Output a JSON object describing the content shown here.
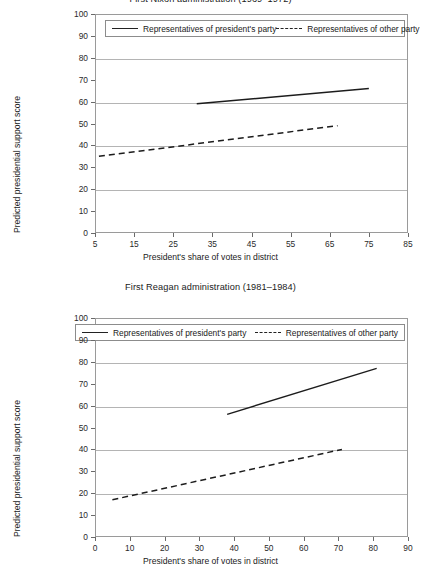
{
  "figure": {
    "y_axis_label": "Predicted presidential support score",
    "x_axis_label": "President's share of votes in district",
    "legend": {
      "president_party": "Representatives of president's party",
      "other_party": "Representatives of other party"
    }
  },
  "chart_data": [
    {
      "type": "line",
      "title": "First Nixon administration (1969–1972)",
      "xlabel": "President's share of votes in district",
      "ylabel": "Predicted presidential support score",
      "xlim": [
        5,
        85
      ],
      "ylim": [
        0,
        100
      ],
      "xticks": [
        5,
        15,
        25,
        35,
        45,
        55,
        65,
        75,
        85
      ],
      "yticks": [
        0,
        10,
        20,
        30,
        40,
        50,
        60,
        70,
        80,
        90,
        100
      ],
      "gridlines_y": [
        20,
        40,
        60,
        80,
        100
      ],
      "grid": "horizontal",
      "legend_position": "upper-center-inside",
      "series": [
        {
          "name": "Representatives of president's party",
          "style": "solid",
          "x": [
            31,
            75
          ],
          "values": [
            59,
            66
          ]
        },
        {
          "name": "Representatives of other party",
          "style": "dashed",
          "x": [
            6,
            67
          ],
          "values": [
            35,
            49
          ]
        }
      ]
    },
    {
      "type": "line",
      "title": "First Reagan administration (1981–1984)",
      "xlabel": "President's share of votes in district",
      "ylabel": "Predicted presidential support score",
      "xlim": [
        0,
        90
      ],
      "ylim": [
        0,
        100
      ],
      "xticks": [
        0,
        10,
        20,
        30,
        40,
        50,
        60,
        70,
        80,
        90
      ],
      "yticks": [
        0,
        10,
        20,
        30,
        40,
        50,
        60,
        70,
        80,
        90,
        100
      ],
      "gridlines_y": [
        20,
        40,
        60,
        80,
        100
      ],
      "grid": "horizontal",
      "legend_position": "upper-center-inside",
      "series": [
        {
          "name": "Representatives of president's party",
          "style": "solid",
          "x": [
            38,
            81
          ],
          "values": [
            56,
            77
          ]
        },
        {
          "name": "Representatives of other party",
          "style": "dashed",
          "x": [
            5,
            71
          ],
          "values": [
            17,
            40
          ]
        }
      ]
    }
  ]
}
